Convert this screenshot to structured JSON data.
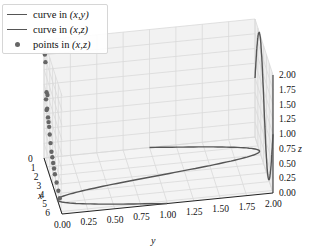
{
  "chart_data": {
    "type": "line3d",
    "title": "",
    "legend": [
      {
        "label": "curve in (x,y)",
        "label_plain": "curve in ",
        "coords": "(x,y)",
        "marker": "line"
      },
      {
        "label": "curve in (x,z)",
        "label_plain": "curve in ",
        "coords": "(x,z)",
        "marker": "line"
      },
      {
        "label": "points in (x,z)",
        "label_plain": "points in ",
        "coords": "(x,z)",
        "marker": "dot"
      }
    ],
    "legend_position": "upper left",
    "axes": {
      "x": {
        "label": "x",
        "ticks": [
          "0",
          "1",
          "2",
          "3",
          "4",
          "5",
          "6"
        ],
        "range": [
          0,
          6.28
        ]
      },
      "y": {
        "label": "y",
        "ticks": [
          "0.00",
          "0.25",
          "0.50",
          "0.75",
          "1.00",
          "1.25",
          "1.50",
          "1.75",
          "2.00"
        ],
        "range": [
          0,
          2
        ]
      },
      "z": {
        "label": "z",
        "ticks": [
          "0.00",
          "0.25",
          "0.50",
          "0.75",
          "1.00",
          "1.25",
          "1.50",
          "1.75",
          "2.00"
        ],
        "range": [
          0,
          2
        ]
      }
    },
    "grid": true,
    "series": [
      {
        "name": "curve in (x,y)",
        "kind": "line",
        "description": "y = 1 + sin(x), z = 0, x in [0, 2π]"
      },
      {
        "name": "curve in (x,z)",
        "kind": "line",
        "description": "z = 1 + sin(x), drawn on y = 2 plane"
      },
      {
        "name": "points in (x,z)",
        "kind": "scatter",
        "description": "random points on y = 0 plane",
        "count": 20
      }
    ],
    "colors": {
      "line": "#555555",
      "points": "#666666",
      "grid": "#d9d9d9",
      "pane": "#f4f4f4"
    }
  }
}
